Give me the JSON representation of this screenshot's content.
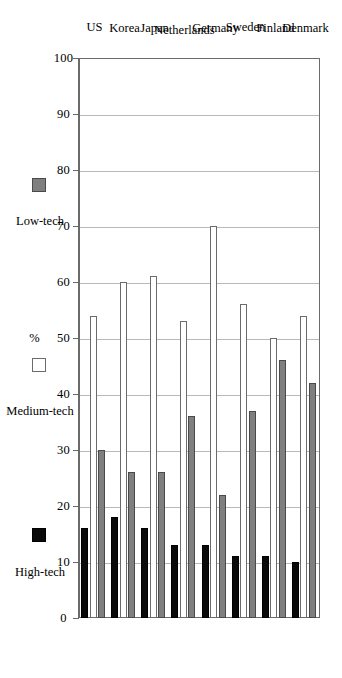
{
  "chart_data": {
    "type": "bar",
    "orientation": "horizontal",
    "title": "",
    "xlabel": "%",
    "ylabel": "",
    "xlim": [
      0,
      100
    ],
    "grid": true,
    "grid_axis": "value",
    "legend_position": "bottom",
    "tick_labels": [
      "100",
      "90",
      "80",
      "70",
      "60",
      "50",
      "40",
      "30",
      "20",
      "10",
      "0"
    ],
    "tick_values": [
      100,
      90,
      80,
      70,
      60,
      50,
      40,
      30,
      20,
      10,
      0
    ],
    "categories": [
      "US",
      "Korea",
      "Japan",
      "Netherlands",
      "Germany",
      "Sweden",
      "Finland",
      "Denmark"
    ],
    "series": [
      {
        "name": "High-tech",
        "color": "#0a0a0a",
        "values": [
          16,
          18,
          16,
          13,
          13,
          11,
          11,
          10
        ]
      },
      {
        "name": "Medium-tech",
        "color": "#ffffff",
        "values": [
          54,
          60,
          61,
          53,
          70,
          56,
          50,
          54
        ]
      },
      {
        "name": "Low-tech",
        "color": "#7f7f7f",
        "values": [
          30,
          26,
          26,
          36,
          22,
          37,
          46,
          42
        ]
      }
    ]
  },
  "axis": {
    "value_axis_label": "%"
  },
  "legend": {
    "items": [
      {
        "label": "High-tech",
        "swatch": "high"
      },
      {
        "label": "Medium-tech",
        "swatch": "medium"
      },
      {
        "label": "Low-tech",
        "swatch": "low"
      }
    ]
  },
  "colors": {
    "high_tech": "#0a0a0a",
    "medium_tech": "#ffffff",
    "low_tech": "#7f7f7f",
    "axis": "#6b6b6b",
    "grid": "#b9b9b9",
    "background": "#ffffff"
  }
}
